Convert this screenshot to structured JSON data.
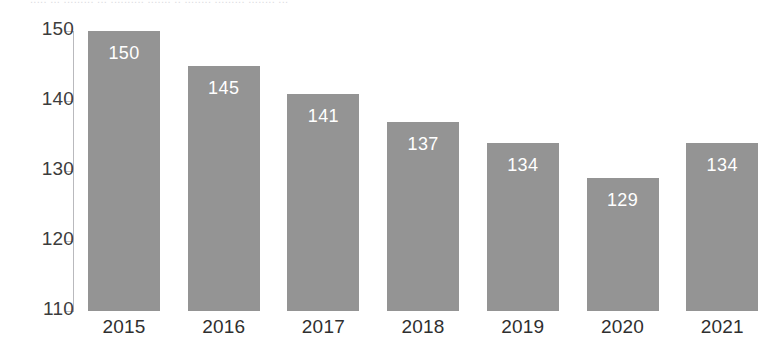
{
  "top_strip": {
    "text": "..... ... ......... ... .......... ....... .. ........ ......... ........ ..."
  },
  "colors": {
    "bar_fill": "#949494",
    "axis_line": "#b9b9bd",
    "tick_label": "#3c3c3c",
    "category_label": "#2f2f2f",
    "data_label": "#ffffff",
    "background": "#ffffff"
  },
  "chart_data": {
    "type": "bar",
    "title": "",
    "subtitle": "",
    "xlabel": "",
    "ylabel": "",
    "categories": [
      "2015",
      "2016",
      "2017",
      "2018",
      "2019",
      "2020",
      "2021"
    ],
    "values": [
      150,
      145,
      141,
      137,
      134,
      129,
      134
    ],
    "data_labels": [
      "150",
      "145",
      "141",
      "137",
      "134",
      "129",
      "134"
    ],
    "ylim": [
      110,
      150
    ],
    "yticks": [
      110,
      120,
      130,
      140,
      150
    ],
    "ytick_labels": [
      "110",
      "120",
      "130",
      "140",
      "150"
    ],
    "grid": false,
    "legend": false,
    "legend_position": "none",
    "series": [
      {
        "name": "",
        "values": [
          150,
          145,
          141,
          137,
          134,
          129,
          134
        ]
      }
    ]
  }
}
